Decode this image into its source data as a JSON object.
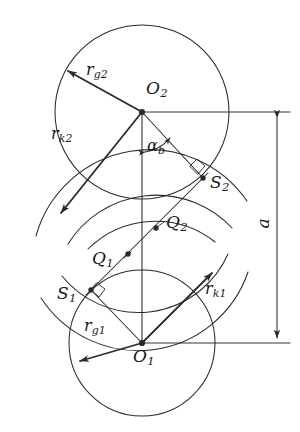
{
  "figure": {
    "domain": "Diagram",
    "background_color": "#ffffff",
    "stroke_color": "#2b2b2b",
    "canvas": {
      "width": 300,
      "height": 432
    }
  },
  "labels": {
    "center_upper": {
      "base": "O",
      "sub": "2"
    },
    "center_lower": {
      "base": "O",
      "sub": "1"
    },
    "radius_g2": {
      "base": "r",
      "sub": "g2"
    },
    "radius_k2": {
      "base": "r",
      "sub": "k2"
    },
    "radius_g1": {
      "base": "r",
      "sub": "g1"
    },
    "radius_k1": {
      "base": "r",
      "sub": "k1"
    },
    "tangent_point_2": {
      "base": "S",
      "sub": "2"
    },
    "tangent_point_1": {
      "base": "S",
      "sub": "1"
    },
    "contact_point_2": {
      "base": "Q",
      "sub": "2"
    },
    "contact_point_1": {
      "base": "Q",
      "sub": "1"
    },
    "pressure_angle": {
      "base": "α",
      "sub": "b"
    },
    "center_distance": {
      "base": "a",
      "sub": ""
    }
  },
  "geometry": {
    "upper_gear": {
      "center": {
        "x": 142,
        "y": 112
      },
      "base_circle_radius": 87,
      "tangent_point_S2": {
        "x": 203,
        "y": 178
      },
      "contact_point_Q2": {
        "x": 156,
        "y": 228
      },
      "vector_rg2_tip": {
        "x": 64,
        "y": 67
      },
      "vector_rk2_tip": {
        "x": 57,
        "y": 217
      }
    },
    "lower_gear": {
      "center": {
        "x": 142,
        "y": 343
      },
      "base_circle_radius": 73,
      "tangent_point_S1": {
        "x": 91,
        "y": 290
      },
      "contact_point_Q1": {
        "x": 128,
        "y": 254
      },
      "vector_rg1_tip": {
        "x": 76,
        "y": 364
      },
      "vector_rk1_tip": {
        "x": 216,
        "y": 269
      }
    },
    "line_of_action": {
      "from": {
        "x": 91,
        "y": 290
      },
      "to": {
        "x": 203,
        "y": 178
      }
    },
    "center_distance_dimension": {
      "x": 277,
      "y_top": 113,
      "y_bottom": 343,
      "value_label": "a"
    },
    "extension_lines": {
      "upper_y": 112,
      "lower_y": 343,
      "x_end": 290
    },
    "pressure_angle_arc": {
      "vertex": {
        "x": 142,
        "y": 112
      },
      "radius": 40,
      "from_deg": 90,
      "to_deg": 47
    }
  }
}
